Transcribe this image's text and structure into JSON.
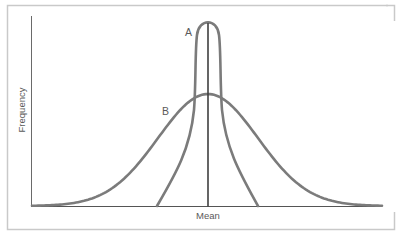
{
  "chart_data": {
    "type": "line",
    "title": "",
    "xlabel": "Mean",
    "ylabel": "Frequency",
    "grid": false,
    "legend": "none",
    "annotations": [
      {
        "text": "A",
        "target": "narrow tall curve"
      },
      {
        "text": "B",
        "target": "wide short curve"
      }
    ],
    "x": [
      -3,
      -2.5,
      -2,
      -1.5,
      -1,
      -0.5,
      0,
      0.5,
      1,
      1.5,
      2,
      2.5,
      3
    ],
    "series": [
      {
        "name": "A",
        "description": "narrow distribution, small spread, high peak",
        "values": [
          0,
          0,
          0,
          0,
          0.02,
          0.35,
          1.0,
          0.35,
          0.02,
          0,
          0,
          0,
          0
        ]
      },
      {
        "name": "B",
        "description": "wide distribution, large spread, lower peak",
        "values": [
          0.01,
          0.04,
          0.11,
          0.26,
          0.49,
          0.8,
          1.0,
          0.8,
          0.49,
          0.26,
          0.11,
          0.04,
          0.01
        ],
        "relative_peak": 0.6
      }
    ],
    "mean_line": {
      "x": 0,
      "label": "Mean"
    },
    "ylim": [
      0,
      1
    ]
  },
  "colors": {
    "curve": "#7b7b7b",
    "mean_line": "#3f3f3f",
    "axis": "#6a6a6a",
    "frame": "#c9c9c9",
    "text": "#5a5a5a"
  }
}
